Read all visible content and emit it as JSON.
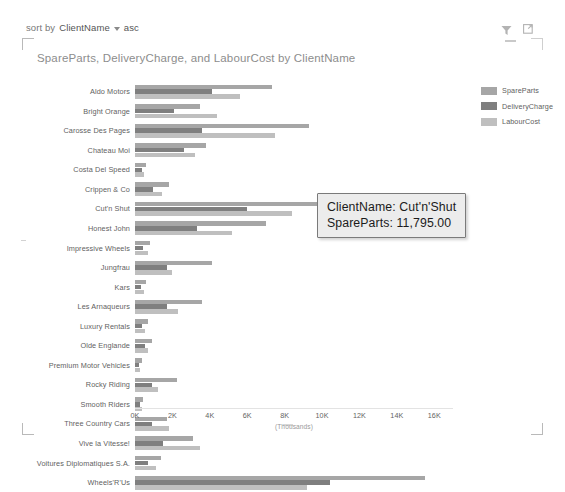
{
  "sort_bar": {
    "prefix": "sort by",
    "field": "ClientName",
    "caret_icon": "chevron-down-icon",
    "direction": "asc"
  },
  "header": {
    "filter_icon": "filter-icon",
    "focus_icon": "focus-mode-icon",
    "minimize_icon": "minimize-icon"
  },
  "chart_data": {
    "type": "bar",
    "orientation": "horizontal",
    "title": "SpareParts, DeliveryCharge, and LabourCost by ClientName",
    "xlabel": "(Thousands)",
    "ylabel": "",
    "xlim": [
      0,
      17000
    ],
    "xticks": [
      0,
      2000,
      4000,
      6000,
      8000,
      10000,
      12000,
      14000,
      16000
    ],
    "xticklabels": [
      "0K",
      "2K",
      "4K",
      "6K",
      "8K",
      "10K",
      "12K",
      "14K",
      "16K"
    ],
    "grid": false,
    "legend_position": "right",
    "colors": {
      "SpareParts": "#a6a6a6",
      "DeliveryCharge": "#7f7f7f",
      "LabourCost": "#bfbfbf"
    },
    "categories": [
      "Aldo Motors",
      "Bright Orange",
      "Carosse Des Pages",
      "Chateau Moi",
      "Costa Del Speed",
      "Crippen & Co",
      "Cut'n Shut",
      "Honest John",
      "Impressive Wheels",
      "Jungfrau",
      "Kars",
      "Les Arnaqueurs",
      "Luxury Rentals",
      "Olde Englande",
      "Premium Motor Vehicles",
      "Rocky Riding",
      "Smooth Riders",
      "Three Country Cars",
      "Vive la Vitesse!",
      "Voitures Diplomatiques S.A.",
      "Wheels'R'Us"
    ],
    "series": [
      {
        "name": "SpareParts",
        "values": [
          7300,
          3500,
          9300,
          3800,
          600,
          1800,
          11795,
          7000,
          800,
          4100,
          600,
          3600,
          700,
          900,
          350,
          2250,
          450,
          1700,
          3100,
          1400,
          15500
        ]
      },
      {
        "name": "DeliveryCharge",
        "values": [
          4100,
          2100,
          3600,
          2600,
          350,
          950,
          6000,
          3300,
          450,
          1700,
          300,
          1700,
          400,
          550,
          200,
          900,
          250,
          900,
          1500,
          700,
          10400
        ]
      },
      {
        "name": "LabourCost",
        "values": [
          5600,
          4400,
          7500,
          3200,
          500,
          1450,
          8400,
          5200,
          700,
          2000,
          500,
          2300,
          550,
          700,
          250,
          1250,
          350,
          1800,
          3500,
          1100,
          9200
        ]
      }
    ]
  },
  "legend": {
    "items": [
      {
        "label": "SpareParts",
        "color": "#a6a6a6"
      },
      {
        "label": "DeliveryCharge",
        "color": "#7f7f7f"
      },
      {
        "label": "LabourCost",
        "color": "#bfbfbf"
      }
    ]
  },
  "tooltip": {
    "line1": "ClientName: Cut'n'Shut",
    "line2": "SpareParts: 11,795.00"
  }
}
